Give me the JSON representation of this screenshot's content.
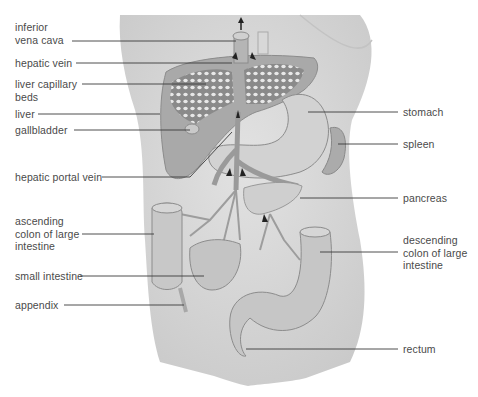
{
  "diagram": {
    "type": "anatomical-illustration",
    "colors": {
      "background": "#ffffff",
      "body_skin": "#d6d6d6",
      "organ_fill": "#bdbdbd",
      "liver": "#a9a9a9",
      "capillary_bed": "#8e8e8e",
      "leader_line": "#3a3a3a",
      "label_text": "#4a4a4a"
    },
    "labels_left": [
      {
        "id": "inferior-vena-cava",
        "text": "inferior\nvena cava"
      },
      {
        "id": "hepatic-vein",
        "text": "hepatic vein"
      },
      {
        "id": "liver-capillary-beds",
        "text": "liver capillary\nbeds"
      },
      {
        "id": "liver",
        "text": "liver"
      },
      {
        "id": "gallbladder",
        "text": "gallbladder"
      },
      {
        "id": "hepatic-portal-vein",
        "text": "hepatic portal vein"
      },
      {
        "id": "ascending-colon",
        "text": "ascending\ncolon of large\nintestine"
      },
      {
        "id": "small-intestine",
        "text": "small intestine"
      },
      {
        "id": "appendix",
        "text": "appendix"
      }
    ],
    "labels_right": [
      {
        "id": "stomach",
        "text": "stomach"
      },
      {
        "id": "spleen",
        "text": "spleen"
      },
      {
        "id": "pancreas",
        "text": "pancreas"
      },
      {
        "id": "descending-colon",
        "text": "descending\ncolon of large\nintestine"
      },
      {
        "id": "rectum",
        "text": "rectum"
      }
    ]
  }
}
